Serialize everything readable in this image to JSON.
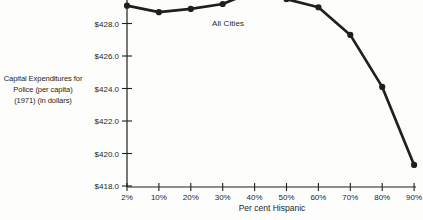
{
  "chart_data": {
    "type": "line",
    "title": "",
    "categories": [
      "2%",
      "10%",
      "20%",
      "30%",
      "40%",
      "50%",
      "60%",
      "70%",
      "80%",
      "90%"
    ],
    "series": [
      {
        "name": "All Cities",
        "values": [
          429.1,
          428.7,
          428.9,
          429.2,
          430.0,
          429.5,
          429.0,
          427.3,
          424.1,
          419.3
        ]
      }
    ],
    "annotation": "All Cities",
    "xlabel": "Per cent Hispanic",
    "ylabel_lines": [
      "Capital Expenditures for",
      "Police (per capita)",
      "(1971) (in dollars)"
    ],
    "yticks": [
      {
        "label": "$418.0",
        "value": 418.0
      },
      {
        "label": "$420.0",
        "value": 420.0
      },
      {
        "label": "$422.0",
        "value": 422.0
      },
      {
        "label": "$424.0",
        "value": 424.0
      },
      {
        "label": "$426.0",
        "value": 426.0
      },
      {
        "label": "$428.0",
        "value": 428.0
      }
    ],
    "ylim_visible": [
      418.0,
      429.4
    ],
    "peak_clipped_at_top": true,
    "grid": false,
    "legend": "inline-annotation",
    "ink_color": "#1f1f1f",
    "background_color": "#fdfdfc"
  }
}
